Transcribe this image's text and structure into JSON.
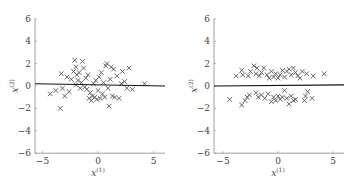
{
  "chart_data": [
    {
      "type": "scatter",
      "title": "",
      "xlabel": "x(1)",
      "ylabel": "x(2)",
      "xlim": [
        -6,
        6
      ],
      "ylim": [
        -6,
        6
      ],
      "xticks": [
        "-5",
        "0",
        "5"
      ],
      "yticks": [
        "6",
        "4",
        "2",
        "0",
        "-2",
        "-4",
        "-6"
      ],
      "grid": false,
      "marker": "x",
      "line": {
        "description": "near-horizontal decision line",
        "y_at_xmin": 0.2,
        "y_at_xmax": 0.0
      },
      "points": [
        [
          -4.3,
          -0.7
        ],
        [
          -3.8,
          -0.4
        ],
        [
          -3.4,
          -2.0
        ],
        [
          -3.3,
          1.1
        ],
        [
          -3.2,
          -0.2
        ],
        [
          -3.0,
          -0.9
        ],
        [
          -2.8,
          0.8
        ],
        [
          -2.6,
          -0.5
        ],
        [
          -2.4,
          0.6
        ],
        [
          -2.2,
          1.3
        ],
        [
          -2.1,
          2.3
        ],
        [
          -2.0,
          1.7
        ],
        [
          -2.0,
          0.1
        ],
        [
          -1.9,
          1.0
        ],
        [
          -1.8,
          0.5
        ],
        [
          -1.7,
          1.2
        ],
        [
          -1.6,
          -0.2
        ],
        [
          -1.5,
          0.3
        ],
        [
          -1.4,
          2.2
        ],
        [
          -1.3,
          1.6
        ],
        [
          -1.2,
          -0.1
        ],
        [
          -1.1,
          0.7
        ],
        [
          -1.0,
          -0.3
        ],
        [
          -0.9,
          1.0
        ],
        [
          -0.8,
          -1.1
        ],
        [
          -0.7,
          -0.6
        ],
        [
          -0.6,
          -1.3
        ],
        [
          -0.5,
          -0.9
        ],
        [
          -0.4,
          0.2
        ],
        [
          -0.3,
          -1.0
        ],
        [
          -0.2,
          0.5
        ],
        [
          -0.1,
          -1.2
        ],
        [
          0.0,
          -0.4
        ],
        [
          0.1,
          0.8
        ],
        [
          0.2,
          -1.1
        ],
        [
          0.3,
          1.2
        ],
        [
          0.4,
          -0.7
        ],
        [
          0.5,
          0.3
        ],
        [
          0.6,
          -1.0
        ],
        [
          0.7,
          1.8
        ],
        [
          0.8,
          2.0
        ],
        [
          0.9,
          -0.2
        ],
        [
          1.0,
          -1.8
        ],
        [
          1.1,
          0.6
        ],
        [
          1.2,
          1.7
        ],
        [
          1.3,
          -0.9
        ],
        [
          1.4,
          1.5
        ],
        [
          1.5,
          -1.0
        ],
        [
          1.7,
          0.9
        ],
        [
          1.9,
          -1.1
        ],
        [
          2.1,
          0.2
        ],
        [
          2.2,
          1.3
        ],
        [
          2.4,
          0.4
        ],
        [
          2.6,
          -0.2
        ],
        [
          2.8,
          1.6
        ],
        [
          3.1,
          -0.3
        ],
        [
          4.2,
          0.2
        ]
      ]
    },
    {
      "type": "scatter",
      "title": "",
      "xlabel": "x(1)",
      "ylabel": "x(2)",
      "xlim": [
        -6,
        6
      ],
      "ylim": [
        -6,
        6
      ],
      "xticks": [
        "-5",
        "0",
        "5"
      ],
      "yticks": [
        "6",
        "4",
        "2",
        "0",
        "-2",
        "-4",
        "-6"
      ],
      "grid": false,
      "marker": "x",
      "line": {
        "description": "horizontal separating line",
        "y_at_xmin": 0.0,
        "y_at_xmax": 0.1
      },
      "points": [
        [
          -3.8,
          0.9
        ],
        [
          -3.3,
          1.4
        ],
        [
          -3.2,
          1.0
        ],
        [
          -2.7,
          0.9
        ],
        [
          -2.5,
          1.3
        ],
        [
          -2.2,
          1.8
        ],
        [
          -2.0,
          1.1
        ],
        [
          -1.9,
          1.6
        ],
        [
          -1.7,
          0.9
        ],
        [
          -1.5,
          1.2
        ],
        [
          -1.3,
          1.6
        ],
        [
          -1.0,
          1.0
        ],
        [
          -0.8,
          0.7
        ],
        [
          -0.6,
          1.3
        ],
        [
          -0.4,
          0.8
        ],
        [
          -0.2,
          1.1
        ],
        [
          0.0,
          0.7
        ],
        [
          0.2,
          1.0
        ],
        [
          0.4,
          1.4
        ],
        [
          0.6,
          0.8
        ],
        [
          0.8,
          1.3
        ],
        [
          1.0,
          1.5
        ],
        [
          1.2,
          1.0
        ],
        [
          1.4,
          1.6
        ],
        [
          1.6,
          1.2
        ],
        [
          1.8,
          0.9
        ],
        [
          2.0,
          0.7
        ],
        [
          2.2,
          1.3
        ],
        [
          2.6,
          1.1
        ],
        [
          3.2,
          0.9
        ],
        [
          4.2,
          1.1
        ],
        [
          -4.4,
          -1.2
        ],
        [
          -3.3,
          -1.7
        ],
        [
          -3.0,
          -1.3
        ],
        [
          -2.8,
          -1.0
        ],
        [
          -2.6,
          -0.8
        ],
        [
          -2.0,
          -0.6
        ],
        [
          -1.8,
          -1.0
        ],
        [
          -1.5,
          -0.8
        ],
        [
          -1.2,
          -1.1
        ],
        [
          -0.9,
          -0.7
        ],
        [
          -0.6,
          -1.4
        ],
        [
          -0.4,
          -1.0
        ],
        [
          -0.2,
          -1.3
        ],
        [
          0.0,
          -0.9
        ],
        [
          0.2,
          -1.2
        ],
        [
          0.4,
          -1.0
        ],
        [
          0.6,
          -0.4
        ],
        [
          0.8,
          -1.1
        ],
        [
          1.0,
          -1.6
        ],
        [
          1.2,
          -0.9
        ],
        [
          1.4,
          -1.3
        ],
        [
          1.6,
          -1.2
        ],
        [
          2.4,
          -1.3
        ],
        [
          2.5,
          -0.9
        ],
        [
          2.7,
          -0.5
        ],
        [
          3.1,
          -1.1
        ]
      ]
    }
  ],
  "ui": {
    "label_x_main": "x",
    "label_x_sup": "(1)",
    "label_y_main": "x",
    "label_y_sup": "(2)"
  }
}
